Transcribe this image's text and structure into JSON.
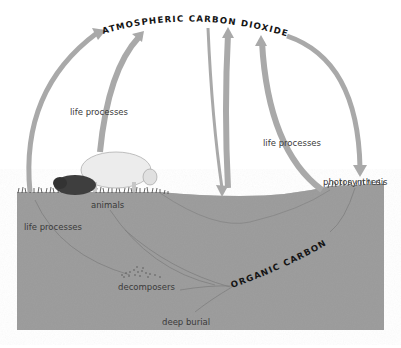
{
  "diagram": {
    "nodes": {
      "atmosphere": "ATMOSPHERIC CARBON DIOXIDE",
      "organic": "ORGANIC CARBON"
    },
    "labels": {
      "life_processes_top_left": "life processes",
      "life_processes_right": "life processes",
      "life_processes_ground": "life processes",
      "photosynthesis": "photosynthesis",
      "animals": "animals",
      "decomposers": "decomposers",
      "deep_burial": "deep burial"
    },
    "colors": {
      "arrow": "#a9a9a9",
      "ground": "#9e9e9e",
      "ground_line": "#7d7d7d",
      "text": "#3a3a3a",
      "heading": "#151515"
    }
  }
}
